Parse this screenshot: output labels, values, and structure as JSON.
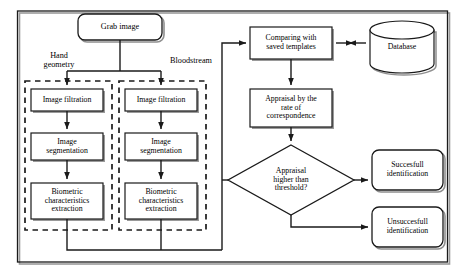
{
  "diagram": {
    "type": "flowchart",
    "stroke_color": "#1a1a1a",
    "shadow_color": "#9a9a9a",
    "background": "#ffffff"
  },
  "nodes": {
    "grab_image": {
      "label": "Grab image",
      "shape": "rounded-rect"
    },
    "hand_geometry_label": {
      "label": "Hand\ngeometry",
      "shape": "text"
    },
    "bloodstream_label": {
      "label": "Bloodstream",
      "shape": "text"
    },
    "left_filtration": {
      "label": "Image filtration",
      "shape": "rect"
    },
    "left_segmentation": {
      "label": "Image\nsegmentation",
      "shape": "rect"
    },
    "left_extraction": {
      "label": "Biometric\ncharacteristics\nextraction",
      "shape": "rect"
    },
    "right_filtration": {
      "label": "Image filtration",
      "shape": "rect"
    },
    "right_segmentation": {
      "label": "Image\nsegmentation",
      "shape": "rect"
    },
    "right_extraction": {
      "label": "Biometric\ncharacteristics\nextraction",
      "shape": "rect"
    },
    "comparing": {
      "label": "Comparing with\nsaved templates",
      "shape": "rect"
    },
    "database": {
      "label": "Database",
      "shape": "cylinder"
    },
    "appraisal": {
      "label": "Appraisal by the\nrate of\ncorrespondence",
      "shape": "rect"
    },
    "decision": {
      "label": "Appraisal\nhigher than\nthreshold?",
      "shape": "diamond"
    },
    "successful": {
      "label": "Succesfull\nidentification",
      "shape": "rounded-rect"
    },
    "unsuccessful": {
      "label": "Unsuccesfull\nidentification",
      "shape": "rounded-rect"
    }
  }
}
